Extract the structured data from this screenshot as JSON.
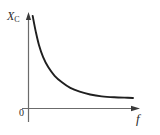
{
  "figure": {
    "background_color": "#ffffff",
    "ink_color": "#2f2f2f",
    "curve_color": "#1f1f1f",
    "axis_color": "#6b6b6b"
  },
  "labels": {
    "y_axis_symbol": "X",
    "y_axis_subscript": "C",
    "x_axis_symbol": "f",
    "origin": "0"
  },
  "chart_data": {
    "type": "line",
    "title": "",
    "xlabel": "f",
    "ylabel": "X_C",
    "subtitle": "",
    "grid": false,
    "legend": null,
    "annotations": [
      "0"
    ],
    "axis_arrows": {
      "x": "right",
      "y": "up"
    },
    "xlim": [
      0,
      1
    ],
    "ylim": [
      0,
      1
    ],
    "tick_labels": {
      "x": [],
      "y": []
    },
    "relationship": "X_C = 1 / (2*pi*f*C)  — capacitive reactance decreases hyperbolically as frequency increases",
    "series": [
      {
        "name": "X_C vs f",
        "x": [
          0.04,
          0.07,
          0.1,
          0.14,
          0.19,
          0.25,
          0.32,
          0.4,
          0.49,
          0.59,
          0.7,
          0.82,
          0.95,
          1.0
        ],
        "y": [
          0.99,
          0.82,
          0.68,
          0.55,
          0.44,
          0.35,
          0.28,
          0.22,
          0.18,
          0.15,
          0.13,
          0.12,
          0.115,
          0.113
        ]
      }
    ]
  }
}
